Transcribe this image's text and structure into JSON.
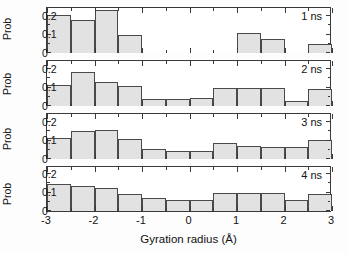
{
  "figure": {
    "xaxis_title": "Gyration radius (Å)",
    "ylabel": "Prob",
    "bar_fill": "#e2e2e2",
    "bar_edge": "#4a4a4a",
    "axis_color": "#3a3a3a"
  },
  "axis": {
    "x_ticks": [
      "-3",
      "-2",
      "-1",
      "0",
      "1",
      "2",
      "3"
    ],
    "y_ticks": [
      "0",
      "0.1",
      "0.2"
    ]
  },
  "panels": [
    {
      "tag": "1 ns"
    },
    {
      "tag": "2 ns"
    },
    {
      "tag": "3 ns"
    },
    {
      "tag": "4 ns"
    }
  ],
  "chart_data": {
    "type": "bar",
    "title": "",
    "xlabel": "Gyration radius (Å)",
    "ylabel": "Prob",
    "xlim": [
      -3,
      3
    ],
    "ylim": [
      0,
      0.25
    ],
    "y_ticks": [
      0,
      0.1,
      0.2
    ],
    "x_ticks": [
      -3,
      -2,
      -1,
      0,
      1,
      2,
      3
    ],
    "x_minor_tick_step": 0.5,
    "grid": false,
    "legend": "none",
    "bin_width": 0.5,
    "bin_edges": [
      -3,
      -2.5,
      -2,
      -1.5,
      -1,
      -0.5,
      0,
      0.5,
      1,
      1.5,
      2,
      2.5,
      3
    ],
    "bin_centers": [
      -2.75,
      -2.25,
      -1.75,
      -1.25,
      -0.75,
      -0.25,
      0.25,
      0.75,
      1.25,
      1.75,
      2.25,
      2.75
    ],
    "panel_layout": "4 stacked panels sharing one x axis",
    "series": [
      {
        "name": "1 ns",
        "values": [
          0.205,
          0.18,
          0.235,
          0.1,
          0.0,
          0.0,
          0.0,
          0.0,
          0.11,
          0.075,
          0.0,
          0.05
        ]
      },
      {
        "name": "2 ns",
        "values": [
          0.115,
          0.185,
          0.13,
          0.11,
          0.04,
          0.04,
          0.045,
          0.1,
          0.1,
          0.1,
          0.025,
          0.09
        ]
      },
      {
        "name": "3 ns",
        "values": [
          0.115,
          0.15,
          0.155,
          0.11,
          0.055,
          0.045,
          0.045,
          0.085,
          0.07,
          0.065,
          0.065,
          0.105
        ]
      },
      {
        "name": "4 ns",
        "values": [
          0.145,
          0.135,
          0.125,
          0.095,
          0.07,
          0.06,
          0.06,
          0.1,
          0.1,
          0.1,
          0.06,
          0.09
        ]
      }
    ]
  }
}
